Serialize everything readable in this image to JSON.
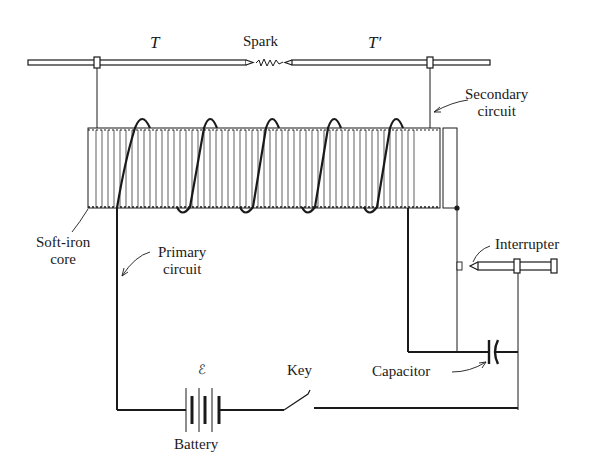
{
  "diagram": {
    "labels": {
      "terminal_left": "T",
      "terminal_right": "T′",
      "spark": "Spark",
      "secondary_circuit": [
        "Secondary",
        "circuit"
      ],
      "soft_iron_core": [
        "Soft-iron",
        "core"
      ],
      "primary_circuit": [
        "Primary",
        "circuit"
      ],
      "interrupter": "Interrupter",
      "emf": "ℰ",
      "battery": "Battery",
      "key": "Key",
      "capacitor": "Capacitor"
    },
    "components": [
      {
        "id": "terminal-T",
        "type": "rod"
      },
      {
        "id": "terminal-T-prime",
        "type": "rod"
      },
      {
        "id": "spark-gap",
        "type": "spark"
      },
      {
        "id": "coil",
        "type": "secondary winding on soft-iron core",
        "primary_turns_shown": 5
      },
      {
        "id": "interrupter",
        "type": "contact screw"
      },
      {
        "id": "battery",
        "type": "battery",
        "cells": 2
      },
      {
        "id": "key",
        "type": "switch",
        "state": "open"
      },
      {
        "id": "capacitor",
        "type": "capacitor"
      }
    ],
    "colors": {
      "ink": "#1a1a1a",
      "background": "#ffffff"
    }
  }
}
